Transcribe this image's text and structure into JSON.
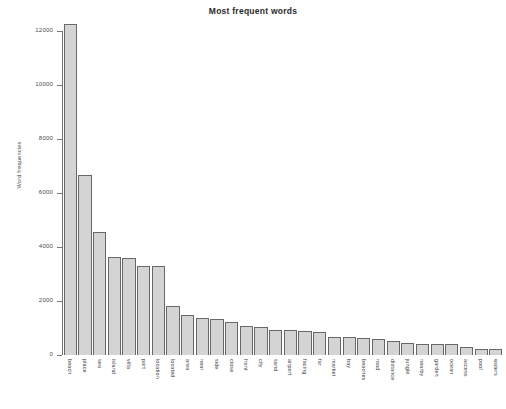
{
  "chart_data": {
    "type": "bar",
    "title": "Most frequent words",
    "xlabel": "",
    "ylabel": "Word frequencies",
    "ylim": [
      0,
      12000
    ],
    "yticks": [
      0,
      2000,
      4000,
      6000,
      8000,
      10000,
      12000
    ],
    "ytick_labels": [
      "0",
      "2000",
      "4000",
      "6000",
      "8000",
      "10000",
      "12000"
    ],
    "grid": false,
    "legend": "none",
    "bar_fill_color": "#d4d4d4",
    "bar_edge_color": "#686868",
    "categories": [
      "beach",
      "place",
      "sea",
      "island",
      "villa",
      "port",
      "location",
      "located",
      "area",
      "near",
      "side",
      "close",
      "front",
      "city",
      "sand",
      "airport",
      "facing",
      "far",
      "market",
      "bay",
      "beaches",
      "road",
      "distance",
      "jungle",
      "nearby",
      "garden",
      "ocean",
      "access",
      "pool",
      "waters"
    ],
    "values": [
      12250,
      6650,
      4550,
      3620,
      3600,
      3300,
      3300,
      1820,
      1480,
      1360,
      1340,
      1220,
      1090,
      1030,
      940,
      910,
      880,
      850,
      680,
      680,
      620,
      590,
      510,
      430,
      420,
      420,
      400,
      300,
      230,
      210
    ]
  }
}
